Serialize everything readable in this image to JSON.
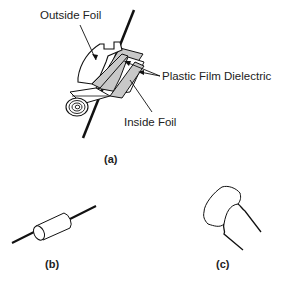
{
  "figure": {
    "part_a": {
      "caption": "(a)",
      "labels": {
        "outside_foil": "Outside Foil",
        "plastic_film_dielectric": "Plastic Film Dielectric",
        "inside_foil": "Inside Foil"
      }
    },
    "part_b": {
      "caption": "(b)"
    },
    "part_c": {
      "caption": "(c)"
    },
    "colors": {
      "line": "#111111",
      "film": "#c8c8c8",
      "foil": "#ffffff",
      "text": "#222222"
    }
  }
}
